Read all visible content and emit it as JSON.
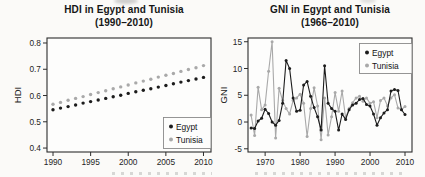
{
  "figure": {
    "background": "#fbfaf8",
    "frame_color": "#2d2d2d",
    "egypt_color": "#1c1c1c",
    "tunisia_color": "#a9a9a9"
  },
  "chart_data": [
    {
      "id": "hdi",
      "type": "scatter",
      "title": "HDI in Egypt and Tunisia",
      "subtitle": "(1990–2010)",
      "ylabel": "HDI",
      "xlabel": "",
      "x_start": 1990,
      "x_step": 1,
      "x_ticks": [
        1990,
        1995,
        2000,
        2005,
        2010
      ],
      "y_ticks": [
        0.4,
        0.5,
        0.6,
        0.7,
        0.8
      ],
      "xlim": [
        1989.2,
        2011.0
      ],
      "ylim": [
        0.385,
        0.819
      ],
      "grid": false,
      "legend": {
        "position": "bottom-right",
        "entries": [
          {
            "label": "Egypt",
            "color": "#1c1c1c"
          },
          {
            "label": "Tunisia",
            "color": "#a9a9a9"
          }
        ]
      },
      "series": [
        {
          "name": "Egypt",
          "color": "#1c1c1c",
          "values": [
            0.546,
            0.552,
            0.558,
            0.564,
            0.571,
            0.577,
            0.583,
            0.589,
            0.595,
            0.601,
            0.608,
            0.614,
            0.62,
            0.626,
            0.632,
            0.638,
            0.645,
            0.651,
            0.657,
            0.663,
            0.669
          ]
        },
        {
          "name": "Tunisia",
          "color": "#a9a9a9",
          "values": [
            0.567,
            0.574,
            0.582,
            0.589,
            0.596,
            0.604,
            0.611,
            0.618,
            0.626,
            0.633,
            0.64,
            0.648,
            0.655,
            0.662,
            0.67,
            0.677,
            0.684,
            0.692,
            0.699,
            0.706,
            0.714
          ]
        }
      ]
    },
    {
      "id": "gni",
      "type": "line",
      "title": "GNI in Egypt and Tunisia",
      "subtitle": "(1966–2010)",
      "ylabel": "GNI",
      "xlabel": "",
      "x_start": 1966,
      "x_step": 1,
      "x_ticks": [
        1970,
        1980,
        1990,
        2000,
        2010
      ],
      "y_ticks": [
        -5,
        0,
        5,
        10,
        15
      ],
      "xlim": [
        1965.1,
        2012.0
      ],
      "ylim": [
        -5.6,
        15.7
      ],
      "grid": false,
      "legend": {
        "position": "top-right",
        "entries": [
          {
            "label": "Egypt",
            "color": "#1c1c1c"
          },
          {
            "label": "Tunisia",
            "color": "#a9a9a9"
          }
        ]
      },
      "series": [
        {
          "name": "Egypt",
          "color": "#1c1c1c",
          "values": [
            -1.1,
            -1.2,
            0.2,
            0.7,
            2.4,
            1.6,
            0.0,
            -0.6,
            0.3,
            3.5,
            11.5,
            10.0,
            4.5,
            2.0,
            2.2,
            6.9,
            7.6,
            4.8,
            2.7,
            1.0,
            -1.5,
            10.5,
            3.5,
            2.5,
            2.0,
            -1.5,
            1.5,
            0.5,
            2.3,
            3.2,
            3.5,
            4.2,
            4.4,
            3.3,
            3.0,
            1.5,
            -0.6,
            0.8,
            1.7,
            2.3,
            5.8,
            6.1,
            5.9,
            2.3,
            1.4
          ]
        },
        {
          "name": "Tunisia",
          "color": "#a9a9a9",
          "values": [
            1.3,
            -2.5,
            6.5,
            2.3,
            3.2,
            9.5,
            15.0,
            -3.0,
            6.3,
            4.0,
            2.5,
            1.5,
            4.0,
            4.5,
            5.2,
            3.5,
            -2.7,
            2.5,
            6.4,
            3.0,
            -3.3,
            4.5,
            -2.4,
            1.0,
            5.5,
            2.0,
            5.8,
            0.8,
            2.5,
            3.6,
            4.5,
            4.8,
            3.9,
            4.5,
            3.5,
            3.8,
            0.8,
            4.0,
            4.5,
            3.0,
            4.5,
            5.1,
            2.6,
            2.3,
            2.9
          ]
        }
      ]
    }
  ]
}
